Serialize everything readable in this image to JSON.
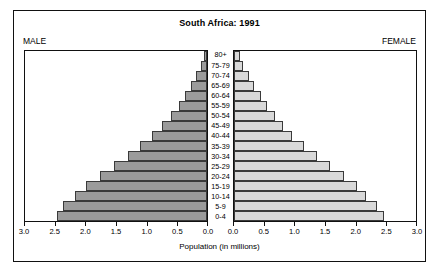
{
  "chart_data": {
    "type": "bar",
    "subtype": "population-pyramid",
    "title": "South Africa: 1991",
    "xlabel": "Population (in millions)",
    "ylabel": "",
    "left_legend": "MALE",
    "right_legend": "FEMALE",
    "categories": [
      "0-4",
      "5-9",
      "10-14",
      "15-19",
      "20-24",
      "25-29",
      "30-34",
      "35-39",
      "40-44",
      "45-49",
      "50-54",
      "55-59",
      "60-64",
      "65-69",
      "70-74",
      "75-79",
      "80+"
    ],
    "xlim": [
      0,
      3.0
    ],
    "axis_direction": "mirrored",
    "tick_values": [
      3.0,
      2.5,
      2.0,
      1.5,
      1.0,
      0.5,
      0.0
    ],
    "left_tick_labels": [
      "3.0",
      "2.5",
      "2.0",
      "1.5",
      "1.0",
      "0.5",
      "0.0"
    ],
    "right_tick_labels": [
      "0.0",
      "0.5",
      "1.0",
      "1.5",
      "2.0",
      "2.5",
      "3.0"
    ],
    "grid": false,
    "legend_position": "top-corners",
    "series": [
      {
        "name": "MALE",
        "color": "#9b9b9b",
        "values": [
          2.48,
          2.37,
          2.18,
          2.0,
          1.77,
          1.53,
          1.31,
          1.1,
          0.9,
          0.74,
          0.6,
          0.47,
          0.36,
          0.26,
          0.18,
          0.1,
          0.05
        ]
      },
      {
        "name": "FEMALE",
        "color": "#d9d9d9",
        "values": [
          2.47,
          2.36,
          2.18,
          2.02,
          1.81,
          1.58,
          1.37,
          1.16,
          0.96,
          0.8,
          0.67,
          0.55,
          0.44,
          0.33,
          0.24,
          0.15,
          0.1
        ]
      }
    ]
  }
}
